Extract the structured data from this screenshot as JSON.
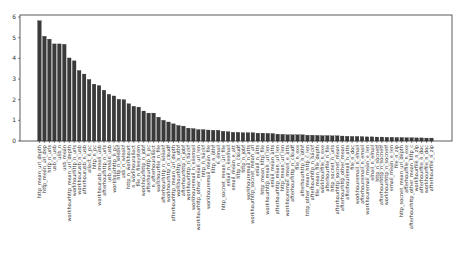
{
  "chart_data": {
    "type": "bar",
    "title": "",
    "xlabel": "",
    "ylabel": "",
    "ylim": [
      0,
      6.1
    ],
    "yticks": [
      0,
      1,
      2,
      3,
      4,
      5,
      6
    ],
    "grid": false,
    "legend": null,
    "bar_color": "#3a3a3a",
    "categories": [
      "http_mean_url_depth",
      "http_mean_url_dep",
      "http_n_urls",
      "usb_n_usb",
      "usb_n",
      "usb_mean",
      "workhourhttp_mean_url_depth",
      "workhourhttp_n_urls",
      "workhourusb_n_usb",
      "afterhourusb_n_usb",
      "allact_n_pc",
      "http_n_pc",
      "workhourusb_mean_usb",
      "afterhourhttp_n_urls",
      "usb_mean_usb",
      "workhourhttp_n_pc",
      "http_n_wleakf",
      "usb_n_wleakf",
      "http_n_workhourt",
      "n_workhourallact",
      "file_n_filesystem",
      "workhourhttp_n_jobf",
      "afterhourhttp_n_pc",
      "n_afterhourallact",
      "workhourfile_n_file",
      "afterhourhttp_n_wleakf",
      "workhourhttp_n_cloudf",
      "afterhourhttp_mean_url_depth",
      "workhourhttp_n_othf",
      "afterhourhttp_n_jobf",
      "workhourhttp_n_hackf",
      "workhouremail_n_exemail",
      "workhourhttp_other_mean_url_len",
      "http_n_hackf",
      "workhouremail_mean_file",
      "http_n_othf",
      "n_email",
      "http_socnet_mean_url_file",
      "email_n_exemail",
      "email_mean_e_att",
      "http_n_cloudf",
      "http_n_jobf",
      "workhouremail_n_atts",
      "workhourhttp_socnet_mean_url",
      "email_n_atts",
      "http_mean_http_file",
      "workhourhttp_mean_url_len",
      "email_mean_atts",
      "afterhourhttp_mean_url_len",
      "http_mean_url_len",
      "workhouremail_mean_e_atts",
      "afterhourhttp_n_cloudf",
      "file_n_exe",
      "afterhourhttp_n_othf",
      "http_other_mean_http_c_len",
      "afterhourhttp_n_hackf",
      "file_mean_file_depth",
      "workhourfile_n_exe",
      "afterhourfile_n_file",
      "http_socnet_n_urls",
      "afterhourhttp_socnet_mean",
      "afterhourhttp_other_mean",
      "afterhouremail_n_atts",
      "file_n_doc",
      "workhouremail_n_email",
      "afterhouremail_n_email",
      "workhouremail_mean_e_len",
      "email_n_email",
      "http_n_socnetf",
      "afterhourhttp_n_socnetf",
      "workhourhttp_n_socnetf",
      "email_mean_e_len",
      "file_n_zip",
      "http_socnet_mean_url_depth",
      "afterhourfile_n_exe",
      "afterhourhttp_other_mean_http_c",
      "workhourfile_n_zip",
      "afterhourfile_n_doc",
      "workhourfile_n_doc",
      "afterhourfile_n_zip"
    ],
    "values": [
      5.82,
      5.07,
      4.93,
      4.7,
      4.7,
      4.68,
      4.02,
      3.88,
      3.41,
      3.24,
      2.98,
      2.75,
      2.68,
      2.46,
      2.26,
      2.18,
      2.02,
      2.0,
      1.8,
      1.68,
      1.64,
      1.45,
      1.35,
      1.35,
      1.15,
      1.0,
      0.92,
      0.83,
      0.75,
      0.72,
      0.62,
      0.6,
      0.55,
      0.55,
      0.53,
      0.52,
      0.52,
      0.47,
      0.45,
      0.42,
      0.42,
      0.4,
      0.4,
      0.4,
      0.38,
      0.38,
      0.37,
      0.36,
      0.33,
      0.32,
      0.3,
      0.3,
      0.3,
      0.3,
      0.28,
      0.28,
      0.27,
      0.26,
      0.26,
      0.25,
      0.25,
      0.24,
      0.23,
      0.22,
      0.22,
      0.21,
      0.2,
      0.2,
      0.19,
      0.19,
      0.18,
      0.18,
      0.17,
      0.17,
      0.16,
      0.16,
      0.15,
      0.15,
      0.14,
      0.14
    ]
  }
}
